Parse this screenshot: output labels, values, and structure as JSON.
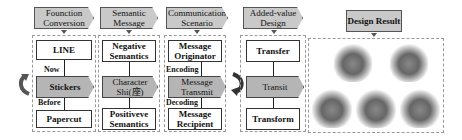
{
  "columns": [
    {
      "header": "Founction Conversion",
      "top": "LINE",
      "middle": "Stickers",
      "bottom": "Papercut",
      "label_up": "Now",
      "label_down": "Before"
    },
    {
      "header": "Semantic Message",
      "top": "Negative Semantics",
      "middle": "Character Shi(座)",
      "bottom": "Positiveve Semantics"
    },
    {
      "header": "Communication Scenario",
      "top": "Message Originator",
      "middle": "Message Transmit",
      "bottom": "Message Recipient",
      "label_up": "Encoding",
      "label_down": "Decoding"
    },
    {
      "header": "Added-value Design",
      "top": "Transfer",
      "middle": "Transit",
      "bottom": "Transform"
    }
  ],
  "result": {
    "header": "Design Result",
    "images": [
      "design-1",
      "design-2",
      "design-3",
      "design-4",
      "design-5"
    ]
  },
  "colors": {
    "header_fill": "#c9c9c9",
    "middle_fill": "#b5b5b5",
    "border": "#333333"
  }
}
